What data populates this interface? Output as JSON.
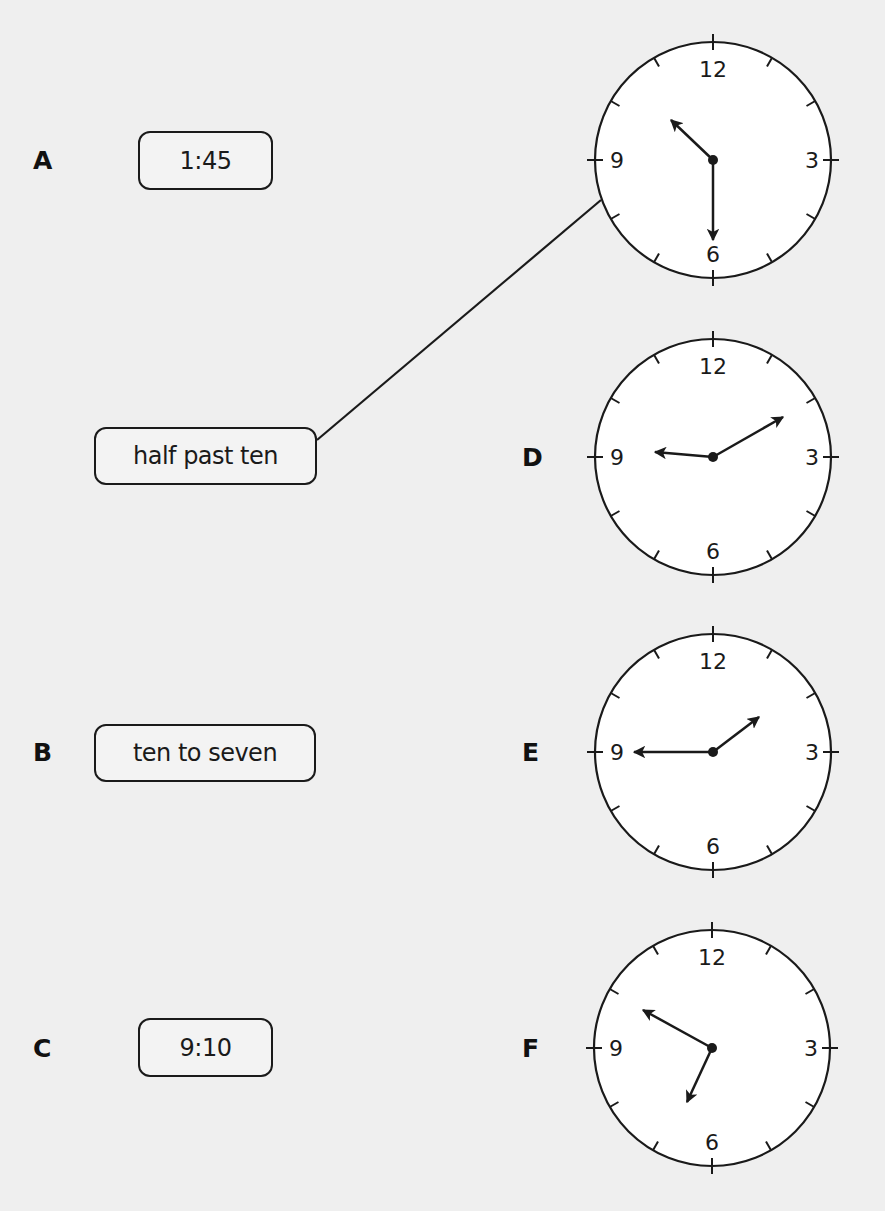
{
  "exercise": {
    "rows": [
      {
        "letter": "A",
        "label": "1:45"
      },
      {
        "letter": "",
        "label": "half past ten"
      },
      {
        "letter": "B",
        "label": "ten to seven"
      },
      {
        "letter": "C",
        "label": "9:10"
      }
    ],
    "clocks": [
      {
        "letter": "",
        "numerals": [
          "12",
          "3",
          "6",
          "9"
        ],
        "time_shown": "10:30"
      },
      {
        "letter": "D",
        "numerals": [
          "12",
          "3",
          "6",
          "9"
        ],
        "time_shown": "9:10"
      },
      {
        "letter": "E",
        "numerals": [
          "12",
          "3",
          "6",
          "9"
        ],
        "time_shown": "1:45"
      },
      {
        "letter": "F",
        "numerals": [
          "12",
          "3",
          "6",
          "9"
        ],
        "time_shown": "6:50"
      }
    ],
    "matched_example": {
      "from": "half past ten",
      "to_clock_index": 0
    }
  },
  "colors": {
    "background": "#efefef",
    "ink": "#1a1a1a",
    "clock_face": "#ffffff"
  }
}
